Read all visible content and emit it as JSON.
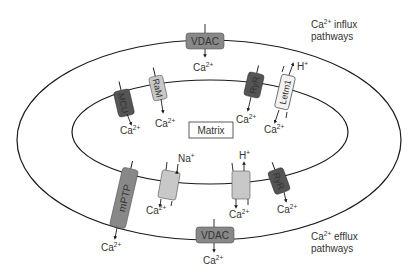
{
  "colors": {
    "membrane": "#1a1a1a",
    "dark_channel": "#555555",
    "medium_channel": "#888888",
    "light_channel": "#c8c8c8",
    "white_channel": "#f2f2f2",
    "text": "#333333"
  },
  "labels": {
    "influx_title_line1": "Ca",
    "influx_title_sup": "2+",
    "influx_title_rest": " influx",
    "influx_title_line2": "pathways",
    "efflux_title_line1": "Ca",
    "efflux_title_sup": "2+",
    "efflux_title_rest": " efflux",
    "efflux_title_line2": "pathways",
    "matrix": "Matrix"
  },
  "channels": {
    "vdac_top": "VDAC",
    "mcu": "MCU",
    "ram": "RaM",
    "ryr_top": "RyR",
    "letm1": "Letm1",
    "mptp": "mPTP",
    "ryr_bottom": "RyR",
    "vdac_bottom": "VDAC"
  },
  "ions": {
    "ca": "Ca",
    "ca_sup": "2+",
    "h": "H",
    "h_sup": "+",
    "na": "Na",
    "na_sup": "+"
  }
}
